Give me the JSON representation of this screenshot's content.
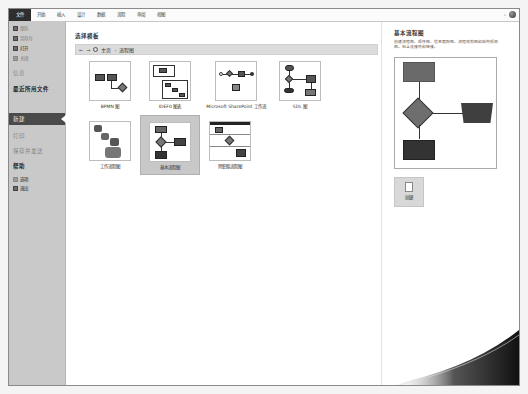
{
  "ribbon": {
    "tabs": [
      "文件",
      "开始",
      "插入",
      "设计",
      "数据",
      "流程",
      "审阅",
      "视图"
    ],
    "active_tab": "文件"
  },
  "sidebar": {
    "items": [
      {
        "label": "保存",
        "icon": "save-icon"
      },
      {
        "label": "另存为",
        "icon": "save-as-icon"
      },
      {
        "label": "打开",
        "icon": "open-icon"
      },
      {
        "label": "关闭",
        "icon": "close-doc-icon"
      },
      {
        "label": "信息"
      },
      {
        "label": "最近所用文件"
      },
      {
        "label": "新建"
      },
      {
        "label": "打印"
      },
      {
        "label": "保存并发送"
      },
      {
        "label": "帮助"
      },
      {
        "label": "选项",
        "icon": "options-icon"
      },
      {
        "label": "退出",
        "icon": "exit-icon"
      }
    ],
    "selected": "新建"
  },
  "main": {
    "title": "选择模板",
    "breadcrumb": {
      "back": "←",
      "forward": "→",
      "home": "主页",
      "separator": "›",
      "current": "流程图"
    },
    "templates": [
      {
        "label": "BPMN 图"
      },
      {
        "label": "IDEF0 图表"
      },
      {
        "label": "Microsoft SharePoint 工作流"
      },
      {
        "label": "SDL 图"
      },
      {
        "label": "工作流程图"
      },
      {
        "label": "基本流程图",
        "selected": true
      },
      {
        "label": "跨职能流程图"
      }
    ]
  },
  "preview_pane": {
    "title": "基本流程图",
    "description": "创建流程图、顺序图、信息跟踪图、流程规划图和结构预测图。包含连接符和链接。",
    "create_label": "创建"
  },
  "colors": {
    "file_tab": "#2e2e2e",
    "sidebar_bg": "#c9c9c9",
    "sidebar_selected": "#4a4a4a",
    "selected_template": "#c8c8c8"
  }
}
